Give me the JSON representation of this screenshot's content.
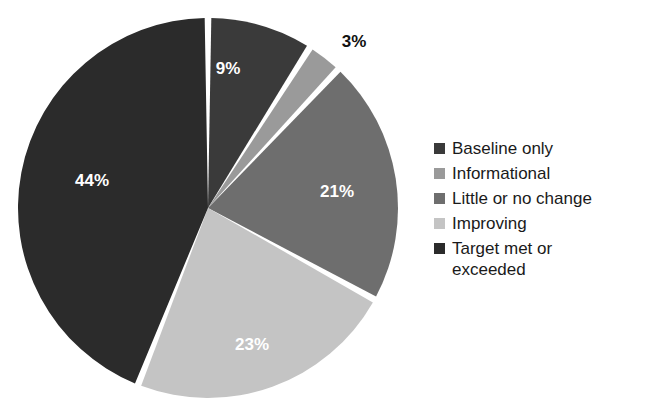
{
  "chart_data": {
    "type": "pie",
    "title": "",
    "subtitle": "",
    "xlabel": "",
    "ylabel": "",
    "legend_position": "right",
    "grid": false,
    "start_angle_deg": 0,
    "direction": "clockwise",
    "categories": [
      "Baseline only",
      "Informational",
      "Little or no change",
      "Improving",
      "Target met or exceeded"
    ],
    "values": [
      9,
      3,
      21,
      23,
      44
    ],
    "value_labels": [
      "9%",
      "3%",
      "21%",
      "23%",
      "44%"
    ],
    "colors": [
      "#3a3a3a",
      "#9a9a9a",
      "#6e6e6e",
      "#c4c4c4",
      "#2b2b2b"
    ],
    "slices": [
      {
        "label": "Baseline only",
        "value": 9,
        "value_label": "9%",
        "color": "#3a3a3a",
        "label_color": "#ffffff",
        "label_placement": "inside",
        "label_x": 228,
        "label_y": 68
      },
      {
        "label": "Informational",
        "value": 3,
        "value_label": "3%",
        "color": "#9a9a9a",
        "label_color": "#111111",
        "label_placement": "outside",
        "label_x": 354,
        "label_y": 41
      },
      {
        "label": "Little or no change",
        "value": 21,
        "value_label": "21%",
        "color": "#6e6e6e",
        "label_color": "#ffffff",
        "label_placement": "inside",
        "label_x": 337,
        "label_y": 191
      },
      {
        "label": "Improving",
        "value": 23,
        "value_label": "23%",
        "color": "#c4c4c4",
        "label_color": "#ffffff",
        "label_placement": "inside",
        "label_x": 252,
        "label_y": 344
      },
      {
        "label": "Target met or exceeded",
        "value": 44,
        "value_label": "44%",
        "color": "#2b2b2b",
        "label_color": "#ffffff",
        "label_placement": "inside",
        "label_x": 92,
        "label_y": 180
      }
    ],
    "separator_color": "#ffffff",
    "background_color": "#ffffff"
  },
  "legend": {
    "items": [
      {
        "label": "Baseline only",
        "color": "#3a3a3a",
        "wrapped": false,
        "line1": "Baseline only",
        "line2": ""
      },
      {
        "label": "Informational",
        "color": "#9a9a9a",
        "wrapped": false,
        "line1": "Informational",
        "line2": ""
      },
      {
        "label": "Little or no change",
        "color": "#6e6e6e",
        "wrapped": false,
        "line1": "Little or no change",
        "line2": ""
      },
      {
        "label": "Improving",
        "color": "#c4c4c4",
        "wrapped": false,
        "line1": "Improving",
        "line2": ""
      },
      {
        "label": "Target met or exceeded",
        "color": "#2b2b2b",
        "wrapped": true,
        "line1": "Target met or",
        "line2": "exceeded"
      }
    ]
  }
}
